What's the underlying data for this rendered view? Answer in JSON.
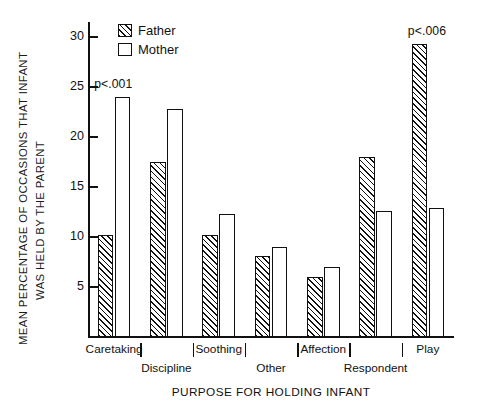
{
  "chart_data": {
    "type": "bar",
    "title": "",
    "xlabel": "PURPOSE FOR HOLDING INFANT",
    "ylabel": "MEAN PERCENTAGE OF OCCASIONS THAT INFANT WAS HELD BY THE PARENT",
    "ylabel_lines": [
      "MEAN PERCENTAGE OF OCCASIONS THAT INFANT",
      "WAS HELD BY THE PARENT"
    ],
    "categories": [
      "Caretaking",
      "Discipline",
      "Soothing",
      "Other",
      "Affection",
      "Respondent",
      "Play"
    ],
    "series": [
      {
        "name": "Father",
        "values": [
          10.2,
          17.5,
          10.2,
          8.1,
          6.0,
          18.0,
          29.3
        ]
      },
      {
        "name": "Mother",
        "values": [
          24.0,
          22.8,
          12.3,
          9.0,
          7.0,
          12.6,
          12.9
        ]
      }
    ],
    "ylim": [
      0,
      31.5
    ],
    "yticks": [
      5,
      10,
      15,
      20,
      25,
      30
    ],
    "ytick_labels": [
      "5",
      "10",
      "15",
      "20",
      "25",
      "30"
    ],
    "grid": false,
    "legend_position": "top-left-inside",
    "annotations": [
      {
        "text": "p<.001",
        "category": "Caretaking"
      },
      {
        "text": "p<.006",
        "category": "Play"
      }
    ]
  },
  "legend": {
    "entries": [
      {
        "label": "Father",
        "pattern": "hatched"
      },
      {
        "label": "Mother",
        "pattern": "open"
      }
    ]
  },
  "axis": {
    "x_title": "PURPOSE FOR HOLDING INFANT"
  }
}
